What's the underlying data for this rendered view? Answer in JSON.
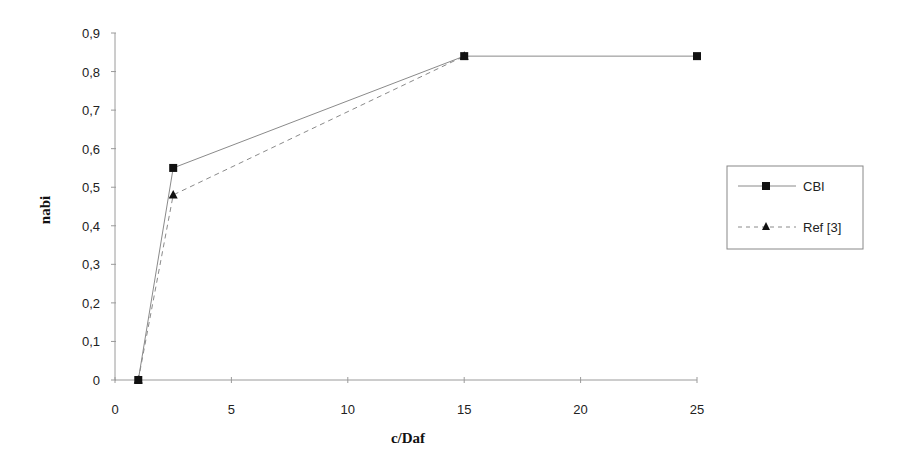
{
  "chart_data": {
    "type": "line",
    "title": "",
    "xlabel": "c/Daf",
    "ylabel": "nabi",
    "xlim": [
      0,
      25
    ],
    "ylim": [
      0,
      0.9
    ],
    "xticks": [
      0,
      5,
      10,
      15,
      20,
      25
    ],
    "xtick_labels": [
      "0",
      "5",
      "10",
      "15",
      "20",
      "25"
    ],
    "yticks": [
      0,
      0.1,
      0.2,
      0.3,
      0.4,
      0.5,
      0.6,
      0.7,
      0.8,
      0.9
    ],
    "ytick_labels": [
      "0",
      "0,1",
      "0,2",
      "0,3",
      "0,4",
      "0,5",
      "0,6",
      "0,7",
      "0,8",
      "0,9"
    ],
    "grid": false,
    "legend_position": "right",
    "series": [
      {
        "name": "CBI",
        "marker": "square",
        "line_style": "solid",
        "x": [
          1,
          2.5,
          15,
          25
        ],
        "y": [
          0,
          0.55,
          0.84,
          0.84
        ]
      },
      {
        "name": "Ref [3]",
        "marker": "triangle",
        "line_style": "dashed",
        "x": [
          1,
          2.5,
          15
        ],
        "y": [
          0,
          0.48,
          0.84
        ]
      }
    ]
  },
  "colors": {
    "axis": "#9a9a9a",
    "series_line": "#8a8a8a",
    "marker": "#111111"
  }
}
